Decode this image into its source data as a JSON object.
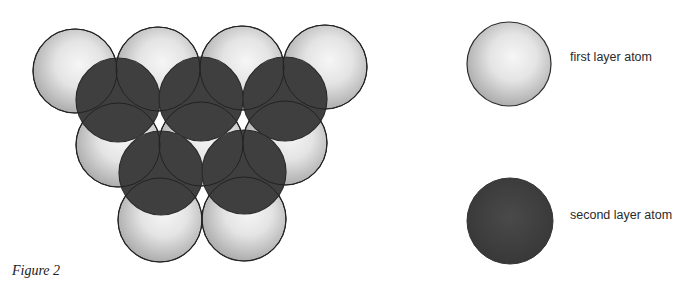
{
  "figure": {
    "caption": "Figure 2",
    "colors": {
      "light_center": "#f6f6f6",
      "light_edge": "#a6a6a6",
      "dark_fill": "#3f3f3f",
      "outline": "#2b2b2b"
    },
    "radius": 42,
    "first_layer_atoms": [
      {
        "cx": 75,
        "cy": 71
      },
      {
        "cx": 158,
        "cy": 69
      },
      {
        "cx": 242,
        "cy": 68
      },
      {
        "cx": 325,
        "cy": 67
      },
      {
        "cx": 118,
        "cy": 145
      },
      {
        "cx": 201,
        "cy": 144
      },
      {
        "cx": 285,
        "cy": 143
      },
      {
        "cx": 160,
        "cy": 220
      },
      {
        "cx": 244,
        "cy": 219
      }
    ],
    "second_layer_atoms": [
      {
        "cx": 118,
        "cy": 100
      },
      {
        "cx": 201,
        "cy": 99
      },
      {
        "cx": 285,
        "cy": 99
      },
      {
        "cx": 161,
        "cy": 173
      },
      {
        "cx": 244,
        "cy": 172
      }
    ]
  },
  "legend": {
    "items": [
      {
        "label": "first layer atom",
        "kind": "light",
        "cx": 509,
        "cy": 64
      },
      {
        "label": "second layer atom",
        "kind": "dark",
        "cx": 510,
        "cy": 221
      }
    ]
  }
}
